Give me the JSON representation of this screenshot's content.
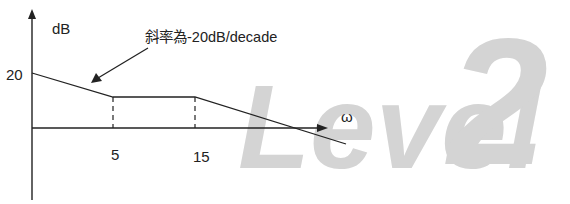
{
  "diagram": {
    "type": "bode-magnitude-asymptote",
    "y_axis_label": "dB",
    "x_axis_label": "ω",
    "y_tick_label": "20",
    "x_tick_labels": [
      "5",
      "15"
    ],
    "annotation": "斜率為-20dB/decade",
    "watermark": {
      "word": "Level",
      "number": "2"
    },
    "colors": {
      "line": "#222222",
      "watermark": "#d4d4d4",
      "background": "#ffffff"
    },
    "segments": [
      {
        "name": "initial-slope",
        "from": "20 dB at origin",
        "to": "corner at ω=5",
        "slope": "-20dB/decade"
      },
      {
        "name": "flat",
        "from": "ω=5",
        "to": "ω=15",
        "slope": "0"
      },
      {
        "name": "final-slope",
        "from": "ω=15",
        "to": "beyond x-axis",
        "slope": "-20dB/decade"
      }
    ]
  }
}
